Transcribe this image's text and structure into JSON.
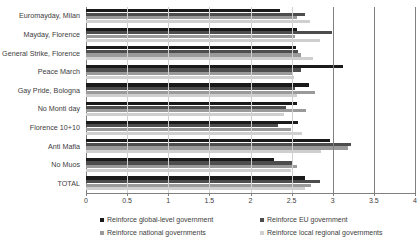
{
  "chart_data": {
    "type": "bar",
    "orientation": "horizontal",
    "title": "",
    "xlabel": "",
    "ylabel": "",
    "xlim": [
      0,
      4
    ],
    "xticks": [
      "0",
      "0.5",
      "1",
      "1.5",
      "2",
      "2.5",
      "3",
      "3.5",
      "4"
    ],
    "xtick_values": [
      0,
      0.5,
      1,
      1.5,
      2,
      2.5,
      3,
      3.5,
      4
    ],
    "grid": true,
    "legend_position": "bottom",
    "categories": [
      "Euromayday, Milan",
      "Mayday, Florence",
      "General Strike, Florence",
      "Peace March",
      "Gay Pride, Bologna",
      "No Monti day",
      "Florence 10+10",
      "Anti Mafia",
      "No Muos",
      "TOTAL"
    ],
    "series": [
      {
        "name": "Reinforce global-level government",
        "color": "#1a1a1a",
        "values": [
          2.36,
          2.56,
          2.55,
          3.12,
          2.71,
          2.57,
          2.58,
          2.97,
          2.28,
          2.66
        ]
      },
      {
        "name": "Reinforce EU government",
        "color": "#4d4d4d",
        "values": [
          2.66,
          2.99,
          2.58,
          2.61,
          2.54,
          2.43,
          2.34,
          3.22,
          2.5,
          2.85
        ]
      },
      {
        "name": "Reinforce national governments",
        "color": "#9a9a9a",
        "values": [
          2.56,
          2.54,
          2.61,
          2.5,
          2.78,
          2.67,
          2.49,
          3.19,
          2.56,
          2.73
        ]
      },
      {
        "name": "Reinforce local regional governments",
        "color": "#cfcfcf",
        "values": [
          2.72,
          2.85,
          2.76,
          2.53,
          2.57,
          2.41,
          2.63,
          2.86,
          2.49,
          2.66
        ]
      }
    ]
  },
  "legend": {
    "items": [
      "Reinforce global-level government",
      "Reinforce EU government",
      "Reinforce national governments",
      "Reinforce local regional governments"
    ]
  }
}
